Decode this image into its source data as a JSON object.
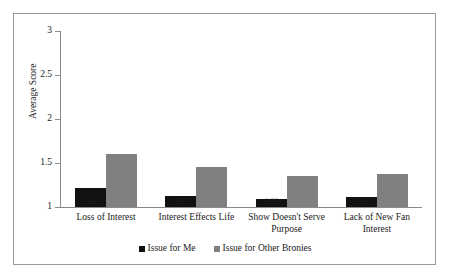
{
  "chart_data": {
    "type": "bar",
    "title": "",
    "subtitle": "",
    "xlabel": "",
    "ylabel": "Average Score",
    "ylim": [
      1,
      3
    ],
    "yticks": [
      "1",
      "1.5",
      "2",
      "2.5",
      "3"
    ],
    "ytick_values": [
      1,
      1.5,
      2,
      2.5,
      3
    ],
    "grid": false,
    "legend_position": "bottom-center",
    "categories": [
      "Loss of Interest",
      "Interest Effects Life",
      "Show Doesn't Serve Purpose",
      "Lack of New Fan Interest"
    ],
    "category_lines": [
      [
        "Loss of Interest"
      ],
      [
        "Interest Effects Life"
      ],
      [
        "Show Doesn't Serve",
        "Purpose"
      ],
      [
        "Lack of New Fan",
        "Interest"
      ]
    ],
    "series": [
      {
        "name": "Issue for Me",
        "color": "#111111",
        "values": [
          1.22,
          1.13,
          1.09,
          1.11
        ]
      },
      {
        "name": "Issue for Other Bronies",
        "color": "#808080",
        "values": [
          1.6,
          1.46,
          1.35,
          1.37
        ]
      }
    ]
  },
  "legend": {
    "items": [
      {
        "label": "Issue for Me",
        "swatch": "black-square-icon"
      },
      {
        "label": "Issue for Other Bronies",
        "swatch": "gray-square-icon"
      }
    ]
  }
}
